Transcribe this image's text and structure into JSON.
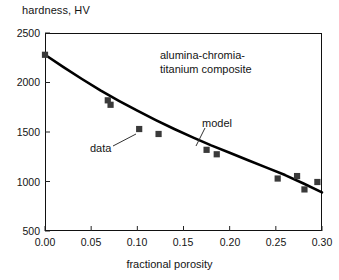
{
  "figure": {
    "y_axis_title": "hardness, HV",
    "x_axis_title": "fractional porosity"
  },
  "annotations": {
    "composite_line1": "alumina-chromia-",
    "composite_line2": "titanium composite",
    "model_label": "model",
    "data_label": "data"
  },
  "axes": {
    "y_ticks": [
      "500",
      "1000",
      "1500",
      "2000",
      "2500"
    ],
    "x_ticks": [
      "0.00",
      "0.05",
      "0.10",
      "0.15",
      "0.20",
      "0.25",
      "0.30"
    ]
  },
  "colors": {
    "axis": "#111111",
    "marker": "#3a3a3a",
    "curve": "#000000",
    "background": "#ffffff",
    "text": "#141414"
  },
  "chart_data": {
    "type": "scatter",
    "title": "",
    "subtitle": "",
    "xlabel": "fractional porosity",
    "ylabel": "hardness, HV",
    "xlim": [
      0.0,
      0.3
    ],
    "ylim": [
      500,
      2500
    ],
    "xtick_values": [
      0.0,
      0.05,
      0.1,
      0.15,
      0.2,
      0.25,
      0.3
    ],
    "ytick_values": [
      500,
      1000,
      1500,
      2000,
      2500
    ],
    "grid": false,
    "legend": "none",
    "annotations": [
      {
        "text": "alumina-chromia-titanium composite",
        "x": 0.175,
        "y": 2150
      },
      {
        "text": "model",
        "x": 0.205,
        "y": 1600,
        "points_to": [
          0.168,
          1360
        ]
      },
      {
        "text": "data",
        "x": 0.05,
        "y": 1340,
        "points_to": [
          0.1,
          1530
        ]
      }
    ],
    "series": [
      {
        "name": "data",
        "type": "scatter",
        "marker": "square",
        "color": "#3a3a3a",
        "x": [
          0.0,
          0.068,
          0.071,
          0.102,
          0.123,
          0.175,
          0.186,
          0.252,
          0.273,
          0.281,
          0.295
        ],
        "y": [
          2280,
          1820,
          1775,
          1530,
          1480,
          1320,
          1275,
          1030,
          1055,
          920,
          995
        ]
      },
      {
        "name": "model",
        "type": "line",
        "color": "#000000",
        "x": [
          0.0,
          0.02,
          0.04,
          0.06,
          0.08,
          0.1,
          0.12,
          0.14,
          0.16,
          0.18,
          0.2,
          0.22,
          0.24,
          0.26,
          0.28,
          0.3
        ],
        "y": [
          2280,
          2155,
          2035,
          1920,
          1815,
          1715,
          1620,
          1530,
          1445,
          1365,
          1290,
          1215,
          1140,
          1065,
          980,
          890
        ]
      }
    ]
  }
}
